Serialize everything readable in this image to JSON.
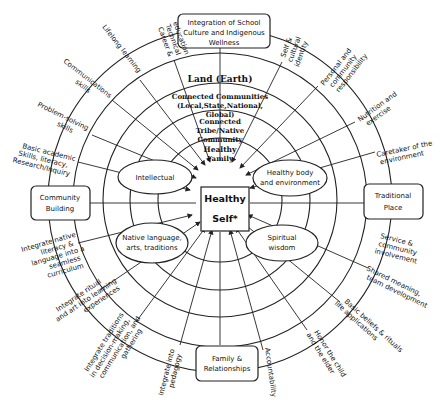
{
  "diagram": {
    "title_box": "Integration of School Culture and Indigenous Wellness",
    "center": {
      "line1": "Healthy",
      "line2": "Self*"
    },
    "rings": [
      "Land (Earth)",
      "Connected Communities (Local,State,National, Global)",
      "Connected Tribe/Native Community",
      "Healthy Family"
    ],
    "side_boxes": {
      "left": [
        "Community",
        "Building"
      ],
      "right": [
        "Traditional",
        "Place"
      ],
      "bottom": [
        "Family &",
        "Relationships"
      ]
    },
    "ellipses": {
      "intellectual": [
        "Intellectual"
      ],
      "healthy_body": [
        "Healthy body",
        "and environment"
      ],
      "native_language": [
        "Native language,",
        "arts, traditions"
      ],
      "spiritual": [
        "Spiritual",
        "wisdom"
      ]
    },
    "outer_labels": {
      "career": [
        "Career &",
        "Technical",
        "education"
      ],
      "lifelong": [
        "Lifelong learning"
      ],
      "communications": [
        "Communications",
        "skills"
      ],
      "problem_solving": [
        "Problem-solving",
        "skills"
      ],
      "basic_academic": [
        "Basic academic",
        "Skills, literacy,",
        "Research/Inquiry"
      ],
      "integrate_native_literacy": [
        "Integrate native",
        "literacy &",
        "language into a",
        "seamless",
        "curriculum"
      ],
      "integrate_ritual": [
        "Integrate ritual",
        "and art into learning",
        "experiences"
      ],
      "integrate_traditions": [
        "Integrate traditions",
        "in decision-making,",
        "communication, and",
        "gathering"
      ],
      "integrate_pedagogy": [
        "Integrate into",
        "pedagogy"
      ],
      "accountability": [
        "Accountability"
      ],
      "honor": [
        "Honor the child",
        "and the elder"
      ],
      "basic_beliefs": [
        "Basic beliefs & rituals",
        "life applications"
      ],
      "shared_meaning": [
        "Shared meaning,",
        "team development"
      ],
      "service": [
        "Service &",
        "community",
        "involvement"
      ],
      "caretaker": [
        "Caretaker of the",
        "environment"
      ],
      "nutrition": [
        "Nutrition and",
        "exercise"
      ],
      "personal": [
        "Personal and",
        "community",
        "responsibility"
      ],
      "self_cultural": [
        "Self &",
        "cultural",
        "identity"
      ]
    }
  }
}
